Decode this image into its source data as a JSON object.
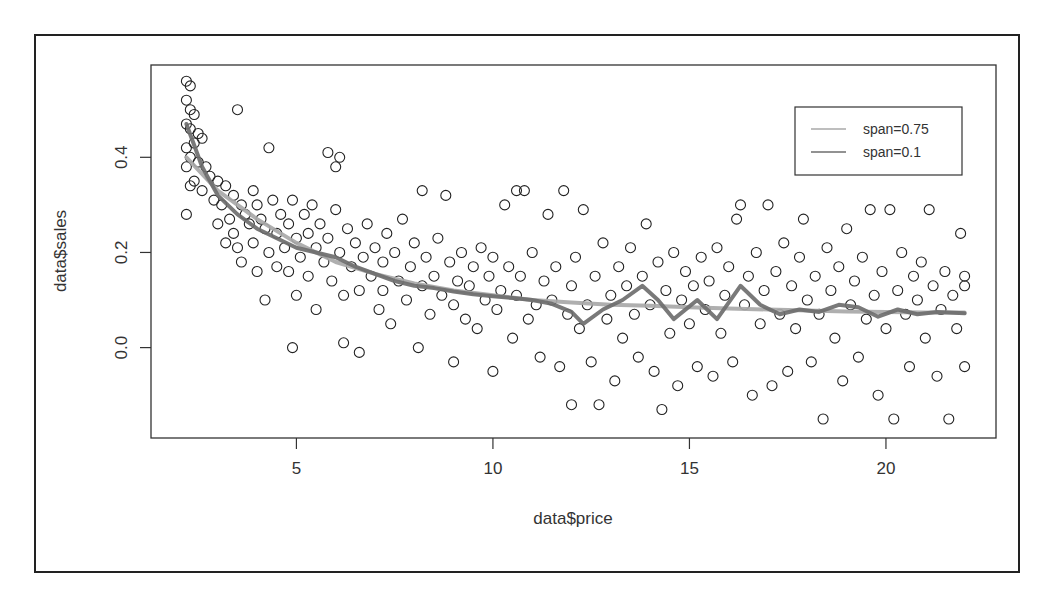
{
  "chart_data": {
    "type": "scatter",
    "title": "",
    "xlabel": "data$price",
    "ylabel": "data$sales",
    "xlim": [
      1.3,
      22.8
    ],
    "ylim": [
      -0.19,
      0.594
    ],
    "x_ticks": [
      5,
      10,
      15,
      20
    ],
    "x_tick_labels": [
      "5",
      "10",
      "15",
      "20"
    ],
    "y_ticks": [
      0.0,
      0.2,
      0.4
    ],
    "y_tick_labels": [
      "0.0",
      "0.2",
      "0.4"
    ],
    "grid": false,
    "legend": {
      "position": "top-right",
      "entries": [
        {
          "label": "span=0.75",
          "color": "#a8a8a8"
        },
        {
          "label": "span=0.1",
          "color": "#6e6e6e"
        }
      ]
    },
    "point_style": {
      "marker": "open-circle",
      "color": "#222222"
    },
    "points_note": "approximate sample of the ~1000 plotted points, estimated from the image",
    "points": [
      [
        2.2,
        0.56
      ],
      [
        2.3,
        0.55
      ],
      [
        2.2,
        0.52
      ],
      [
        2.3,
        0.5
      ],
      [
        2.4,
        0.49
      ],
      [
        2.2,
        0.47
      ],
      [
        2.3,
        0.46
      ],
      [
        2.5,
        0.45
      ],
      [
        2.4,
        0.43
      ],
      [
        2.6,
        0.44
      ],
      [
        2.2,
        0.42
      ],
      [
        2.3,
        0.4
      ],
      [
        2.5,
        0.39
      ],
      [
        2.2,
        0.38
      ],
      [
        2.7,
        0.38
      ],
      [
        2.4,
        0.35
      ],
      [
        2.3,
        0.34
      ],
      [
        2.6,
        0.33
      ],
      [
        2.2,
        0.28
      ],
      [
        2.8,
        0.36
      ],
      [
        3.0,
        0.35
      ],
      [
        2.9,
        0.31
      ],
      [
        3.1,
        0.3
      ],
      [
        3.2,
        0.34
      ],
      [
        3.0,
        0.26
      ],
      [
        3.3,
        0.27
      ],
      [
        3.4,
        0.32
      ],
      [
        3.5,
        0.5
      ],
      [
        3.2,
        0.22
      ],
      [
        3.4,
        0.24
      ],
      [
        3.6,
        0.3
      ],
      [
        3.7,
        0.28
      ],
      [
        3.5,
        0.21
      ],
      [
        3.8,
        0.26
      ],
      [
        3.6,
        0.18
      ],
      [
        3.9,
        0.33
      ],
      [
        4.0,
        0.3
      ],
      [
        3.9,
        0.22
      ],
      [
        4.1,
        0.27
      ],
      [
        4.2,
        0.25
      ],
      [
        4.0,
        0.16
      ],
      [
        4.3,
        0.42
      ],
      [
        4.3,
        0.2
      ],
      [
        4.4,
        0.31
      ],
      [
        4.5,
        0.24
      ],
      [
        4.2,
        0.1
      ],
      [
        4.6,
        0.28
      ],
      [
        4.7,
        0.21
      ],
      [
        4.5,
        0.17
      ],
      [
        4.8,
        0.26
      ],
      [
        4.9,
        0.31
      ],
      [
        4.8,
        0.16
      ],
      [
        5.0,
        0.23
      ],
      [
        4.9,
        0.0
      ],
      [
        5.1,
        0.19
      ],
      [
        5.2,
        0.28
      ],
      [
        5.0,
        0.11
      ],
      [
        5.3,
        0.24
      ],
      [
        5.4,
        0.3
      ],
      [
        5.3,
        0.15
      ],
      [
        5.5,
        0.21
      ],
      [
        5.6,
        0.26
      ],
      [
        5.5,
        0.08
      ],
      [
        5.7,
        0.18
      ],
      [
        5.8,
        0.41
      ],
      [
        5.8,
        0.23
      ],
      [
        5.9,
        0.14
      ],
      [
        6.0,
        0.29
      ],
      [
        6.0,
        0.38
      ],
      [
        6.1,
        0.4
      ],
      [
        6.1,
        0.2
      ],
      [
        6.2,
        0.11
      ],
      [
        6.3,
        0.25
      ],
      [
        6.2,
        0.01
      ],
      [
        6.4,
        0.17
      ],
      [
        6.5,
        0.22
      ],
      [
        6.6,
        0.12
      ],
      [
        6.7,
        0.19
      ],
      [
        6.6,
        -0.01
      ],
      [
        6.8,
        0.26
      ],
      [
        6.9,
        0.15
      ],
      [
        7.0,
        0.21
      ],
      [
        7.1,
        0.08
      ],
      [
        7.2,
        0.18
      ],
      [
        7.3,
        0.24
      ],
      [
        7.2,
        0.12
      ],
      [
        7.4,
        0.05
      ],
      [
        7.5,
        0.2
      ],
      [
        7.6,
        0.14
      ],
      [
        7.7,
        0.27
      ],
      [
        7.8,
        0.1
      ],
      [
        7.9,
        0.17
      ],
      [
        8.0,
        0.22
      ],
      [
        8.1,
        0.0
      ],
      [
        8.2,
        0.33
      ],
      [
        8.2,
        0.13
      ],
      [
        8.3,
        0.19
      ],
      [
        8.4,
        0.07
      ],
      [
        8.5,
        0.15
      ],
      [
        8.6,
        0.23
      ],
      [
        8.7,
        0.11
      ],
      [
        8.8,
        0.32
      ],
      [
        8.9,
        0.18
      ],
      [
        9.0,
        -0.03
      ],
      [
        9.0,
        0.09
      ],
      [
        9.1,
        0.14
      ],
      [
        9.2,
        0.2
      ],
      [
        9.3,
        0.06
      ],
      [
        9.4,
        0.13
      ],
      [
        9.5,
        0.17
      ],
      [
        9.6,
        0.04
      ],
      [
        9.7,
        0.21
      ],
      [
        9.8,
        0.1
      ],
      [
        9.9,
        0.15
      ],
      [
        10.0,
        0.19
      ],
      [
        10.0,
        -0.05
      ],
      [
        10.1,
        0.08
      ],
      [
        10.2,
        0.12
      ],
      [
        10.3,
        0.3
      ],
      [
        10.4,
        0.17
      ],
      [
        10.5,
        0.02
      ],
      [
        10.6,
        0.33
      ],
      [
        10.6,
        0.11
      ],
      [
        10.7,
        0.15
      ],
      [
        10.8,
        0.33
      ],
      [
        10.9,
        0.06
      ],
      [
        11.0,
        0.2
      ],
      [
        11.1,
        0.09
      ],
      [
        11.2,
        -0.02
      ],
      [
        11.3,
        0.14
      ],
      [
        11.4,
        0.28
      ],
      [
        11.5,
        0.1
      ],
      [
        11.6,
        0.17
      ],
      [
        11.7,
        -0.04
      ],
      [
        11.8,
        0.33
      ],
      [
        11.9,
        0.07
      ],
      [
        12.0,
        0.13
      ],
      [
        12.0,
        -0.12
      ],
      [
        12.1,
        0.19
      ],
      [
        12.2,
        0.04
      ],
      [
        12.3,
        0.29
      ],
      [
        12.4,
        0.09
      ],
      [
        12.5,
        -0.03
      ],
      [
        12.6,
        0.15
      ],
      [
        12.7,
        -0.12
      ],
      [
        12.8,
        0.22
      ],
      [
        12.9,
        0.06
      ],
      [
        13.0,
        0.11
      ],
      [
        13.1,
        -0.07
      ],
      [
        13.2,
        0.17
      ],
      [
        13.3,
        0.02
      ],
      [
        13.4,
        0.13
      ],
      [
        13.5,
        0.21
      ],
      [
        13.6,
        0.07
      ],
      [
        13.7,
        -0.02
      ],
      [
        13.8,
        0.15
      ],
      [
        13.9,
        0.26
      ],
      [
        14.0,
        0.09
      ],
      [
        14.1,
        -0.05
      ],
      [
        14.2,
        0.18
      ],
      [
        14.3,
        -0.13
      ],
      [
        14.4,
        0.12
      ],
      [
        14.5,
        0.03
      ],
      [
        14.6,
        0.2
      ],
      [
        14.7,
        -0.08
      ],
      [
        14.8,
        0.1
      ],
      [
        14.9,
        0.16
      ],
      [
        15.0,
        0.05
      ],
      [
        15.1,
        0.13
      ],
      [
        15.2,
        -0.04
      ],
      [
        15.3,
        0.19
      ],
      [
        15.4,
        0.08
      ],
      [
        15.5,
        0.14
      ],
      [
        15.6,
        -0.06
      ],
      [
        15.7,
        0.21
      ],
      [
        15.8,
        0.03
      ],
      [
        15.9,
        0.11
      ],
      [
        16.0,
        0.17
      ],
      [
        16.1,
        -0.03
      ],
      [
        16.2,
        0.27
      ],
      [
        16.3,
        0.3
      ],
      [
        16.4,
        0.09
      ],
      [
        16.5,
        0.15
      ],
      [
        16.6,
        -0.1
      ],
      [
        16.7,
        0.2
      ],
      [
        16.8,
        0.05
      ],
      [
        16.9,
        0.12
      ],
      [
        17.0,
        0.3
      ],
      [
        17.1,
        -0.08
      ],
      [
        17.2,
        0.16
      ],
      [
        17.3,
        0.07
      ],
      [
        17.4,
        0.22
      ],
      [
        17.5,
        -0.05
      ],
      [
        17.6,
        0.13
      ],
      [
        17.7,
        0.04
      ],
      [
        17.8,
        0.19
      ],
      [
        17.9,
        0.27
      ],
      [
        18.0,
        0.1
      ],
      [
        18.1,
        -0.03
      ],
      [
        18.2,
        0.15
      ],
      [
        18.3,
        0.07
      ],
      [
        18.4,
        -0.15
      ],
      [
        18.5,
        0.21
      ],
      [
        18.6,
        0.12
      ],
      [
        18.7,
        0.02
      ],
      [
        18.8,
        0.17
      ],
      [
        18.9,
        -0.07
      ],
      [
        19.0,
        0.25
      ],
      [
        19.1,
        0.09
      ],
      [
        19.2,
        0.14
      ],
      [
        19.3,
        -0.02
      ],
      [
        19.4,
        0.19
      ],
      [
        19.5,
        0.06
      ],
      [
        19.6,
        0.29
      ],
      [
        19.7,
        0.11
      ],
      [
        19.8,
        -0.1
      ],
      [
        19.9,
        0.16
      ],
      [
        20.0,
        0.04
      ],
      [
        20.1,
        0.29
      ],
      [
        20.2,
        -0.15
      ],
      [
        20.3,
        0.12
      ],
      [
        20.4,
        0.2
      ],
      [
        20.5,
        0.07
      ],
      [
        20.6,
        -0.04
      ],
      [
        20.7,
        0.15
      ],
      [
        20.8,
        0.1
      ],
      [
        20.9,
        0.18
      ],
      [
        21.0,
        0.02
      ],
      [
        21.1,
        0.29
      ],
      [
        21.2,
        0.13
      ],
      [
        21.3,
        -0.06
      ],
      [
        21.4,
        0.08
      ],
      [
        21.5,
        0.16
      ],
      [
        21.6,
        -0.15
      ],
      [
        21.7,
        0.11
      ],
      [
        21.8,
        0.04
      ],
      [
        21.9,
        0.24
      ],
      [
        22.0,
        0.15
      ],
      [
        22.0,
        0.13
      ],
      [
        22.0,
        -0.04
      ]
    ],
    "series": [
      {
        "name": "span=0.75",
        "type": "line",
        "color": "#a8a8a8",
        "x": [
          2.2,
          3,
          4,
          5,
          6,
          7,
          8,
          9,
          10,
          11,
          12,
          13,
          14,
          15,
          16,
          17,
          18,
          19,
          20,
          21,
          22
        ],
        "y": [
          0.4,
          0.33,
          0.27,
          0.22,
          0.18,
          0.155,
          0.135,
          0.12,
          0.11,
          0.1,
          0.095,
          0.09,
          0.088,
          0.085,
          0.082,
          0.08,
          0.078,
          0.076,
          0.075,
          0.074,
          0.074
        ]
      },
      {
        "name": "span=0.1",
        "type": "line",
        "color": "#6e6e6e",
        "x": [
          2.2,
          2.6,
          3,
          3.5,
          4,
          4.5,
          5,
          5.5,
          6,
          6.5,
          7,
          7.5,
          8,
          8.5,
          9,
          9.5,
          10,
          10.5,
          11,
          11.5,
          12,
          12.3,
          12.8,
          13.3,
          13.8,
          14.2,
          14.6,
          15.2,
          15.7,
          16.3,
          16.8,
          17.3,
          17.8,
          18.3,
          18.8,
          19.3,
          19.8,
          20.3,
          20.8,
          21.3,
          22
        ],
        "y": [
          0.47,
          0.38,
          0.32,
          0.28,
          0.25,
          0.23,
          0.21,
          0.2,
          0.19,
          0.17,
          0.155,
          0.14,
          0.13,
          0.125,
          0.118,
          0.112,
          0.108,
          0.104,
          0.1,
          0.092,
          0.075,
          0.05,
          0.08,
          0.1,
          0.13,
          0.1,
          0.06,
          0.1,
          0.06,
          0.13,
          0.09,
          0.07,
          0.08,
          0.075,
          0.09,
          0.085,
          0.065,
          0.08,
          0.07,
          0.075,
          0.072
        ]
      }
    ]
  }
}
